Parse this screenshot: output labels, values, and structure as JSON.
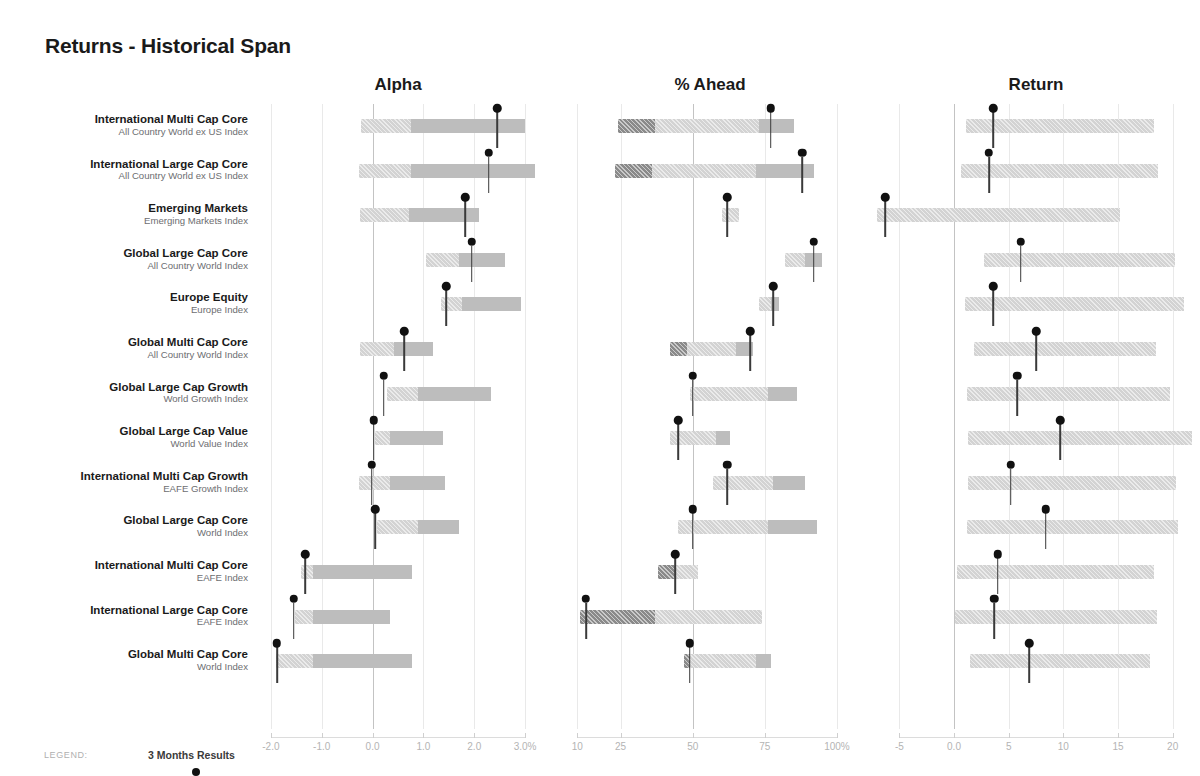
{
  "title": "Returns - Historical Span",
  "legend": {
    "label": "LEGEND:",
    "series_name": "3 Months Results",
    "marker": "filled-circle"
  },
  "colors": {
    "span_light": "#d3d3d3",
    "span_mid": "#bdbdbd",
    "span_dark": "#9e9e9e",
    "span_darker": "#8a8a8a",
    "marker": "#111111",
    "zero_line": "#c3c3c3",
    "grid": "#e9e9e9",
    "title": "#1a1a1a",
    "index_text": "#6d6e71",
    "tick_text": "#b4b4b4"
  },
  "rows": [
    {
      "name": "International Multi Cap Core",
      "index": "All Country World ex US Index"
    },
    {
      "name": "International Large Cap Core",
      "index": "All Country World ex US Index"
    },
    {
      "name": "Emerging Markets",
      "index": "Emerging Markets Index"
    },
    {
      "name": "Global Large Cap Core",
      "index": "All Country World Index"
    },
    {
      "name": "Europe Equity",
      "index": "Europe Index"
    },
    {
      "name": "Global Multi Cap Core",
      "index": "All Country World Index"
    },
    {
      "name": "Global Large Cap Growth",
      "index": "World Growth Index"
    },
    {
      "name": "Global Large Cap Value",
      "index": "World Value Index"
    },
    {
      "name": "International Multi Cap Growth",
      "index": "EAFE Growth Index"
    },
    {
      "name": "Global Large Cap Core",
      "index": "World Index"
    },
    {
      "name": "International Multi Cap Core",
      "index": "EAFE Index"
    },
    {
      "name": "International Large Cap Core",
      "index": "EAFE Index"
    },
    {
      "name": "Global Multi Cap Core",
      "index": "World Index"
    }
  ],
  "chart_data": [
    {
      "type": "bar",
      "title": "Alpha",
      "xlabel": "",
      "ylabel": "",
      "xlim": [
        -2.45,
        3.45
      ],
      "ticks": [
        -2.0,
        -1.0,
        0.0,
        1.0,
        2.0,
        3.0
      ],
      "tick_labels": [
        "-2.0",
        "-1.0",
        "0.0",
        "1.0",
        "2.0",
        "3.0%"
      ],
      "zero_at": 0.0,
      "grid": true,
      "categories": [
        "International Multi Cap Core",
        "International Large Cap Core",
        "Emerging Markets",
        "Global Large Cap Core",
        "Europe Equity",
        "Global Multi Cap Core",
        "Global Large Cap Growth",
        "Global Large Cap Value",
        "International Multi Cap Growth",
        "Global Large Cap Core",
        "International Multi Cap Core",
        "International Large Cap Core",
        "Global Multi Cap Core"
      ],
      "series": [
        {
          "name": "span_low",
          "values": [
            -0.22,
            -0.27,
            -0.25,
            1.05,
            1.35,
            -0.25,
            0.28,
            0.05,
            -0.27,
            0.08,
            -1.4,
            -1.52,
            -1.9
          ]
        },
        {
          "name": "span_mid",
          "values": [
            0.76,
            0.75,
            0.72,
            1.7,
            1.75,
            0.42,
            0.9,
            0.35,
            0.35,
            0.9,
            -1.18,
            -1.18,
            -1.18
          ]
        },
        {
          "name": "span_high",
          "values": [
            3.0,
            3.2,
            2.1,
            2.6,
            2.92,
            1.18,
            2.32,
            1.38,
            1.42,
            1.7,
            0.78,
            0.35,
            0.78
          ]
        },
        {
          "name": "3 Months Results",
          "values": [
            2.45,
            2.28,
            1.82,
            1.95,
            1.45,
            0.62,
            0.22,
            0.02,
            -0.02,
            0.05,
            -1.32,
            -1.55,
            -1.88
          ]
        }
      ]
    },
    {
      "type": "bar",
      "title": "% Ahead",
      "xlabel": "",
      "ylabel": "",
      "xlim": [
        4,
        108
      ],
      "ticks": [
        10,
        25,
        50,
        75,
        100
      ],
      "tick_labels": [
        "10",
        "25",
        "50",
        "75",
        "100%"
      ],
      "zero_at": 50,
      "grid": true,
      "categories": [
        "International Multi Cap Core",
        "International Large Cap Core",
        "Emerging Markets",
        "Global Large Cap Core",
        "Europe Equity",
        "Global Multi Cap Core",
        "Global Large Cap Growth",
        "Global Large Cap Value",
        "International Multi Cap Growth",
        "Global Large Cap Core",
        "International Multi Cap Core",
        "International Large Cap Core",
        "Global Multi Cap Core"
      ],
      "series": [
        {
          "name": "span_low",
          "values": [
            24,
            23,
            60,
            82,
            73,
            42,
            49,
            42,
            57,
            45,
            38,
            11,
            47
          ]
        },
        {
          "name": "span_mid",
          "values": [
            37,
            36,
            60,
            82,
            73,
            48,
            49,
            42,
            57,
            45,
            44,
            37,
            49
          ]
        },
        {
          "name": "span_high",
          "values": [
            73,
            72,
            66,
            89,
            77,
            65,
            76,
            58,
            78,
            76,
            52,
            74,
            72
          ]
        },
        {
          "name": "span_max",
          "values": [
            85,
            92,
            66,
            95,
            80,
            71,
            86,
            63,
            89,
            93,
            52,
            74,
            77
          ]
        },
        {
          "name": "3 Months Results",
          "values": [
            77,
            88,
            62,
            92,
            78,
            70,
            50,
            45,
            62,
            50,
            44,
            13,
            49
          ]
        }
      ]
    },
    {
      "type": "bar",
      "title": "Return",
      "xlabel": "",
      "ylabel": "",
      "xlim": [
        -7.5,
        22.5
      ],
      "ticks": [
        -5,
        0,
        5,
        10,
        15,
        20
      ],
      "tick_labels": [
        "-5",
        "0.0",
        "5",
        "10",
        "15",
        "20"
      ],
      "zero_at": 0,
      "grid": true,
      "categories": [
        "International Multi Cap Core",
        "International Large Cap Core",
        "Emerging Markets",
        "Global Large Cap Core",
        "Europe Equity",
        "Global Multi Cap Core",
        "Global Large Cap Growth",
        "Global Large Cap Value",
        "International Multi Cap Growth",
        "Global Large Cap Core",
        "International Multi Cap Core",
        "International Large Cap Core",
        "Global Multi Cap Core"
      ],
      "series": [
        {
          "name": "span_low",
          "values": [
            1.1,
            0.6,
            -7.0,
            2.7,
            1.0,
            1.8,
            1.2,
            1.3,
            1.3,
            1.2,
            0.3,
            0.1,
            1.5
          ]
        },
        {
          "name": "span_high",
          "values": [
            18.3,
            18.7,
            15.2,
            20.2,
            21.0,
            18.5,
            19.8,
            21.8,
            20.3,
            20.5,
            18.3,
            18.6,
            17.9
          ]
        },
        {
          "name": "3 Months Results",
          "values": [
            3.6,
            3.2,
            -6.3,
            6.1,
            3.6,
            7.5,
            5.8,
            9.7,
            5.2,
            8.4,
            4.0,
            3.7,
            6.9
          ]
        }
      ]
    }
  ]
}
